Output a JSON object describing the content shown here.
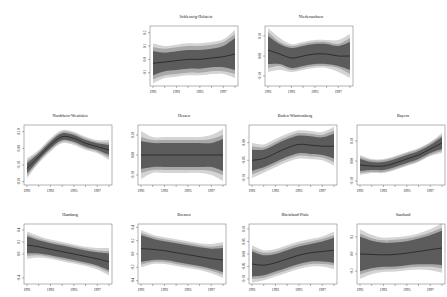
{
  "figure": {
    "background": "#ffffff",
    "band_colors": {
      "outer": "#d4d4d4",
      "middle": "#a8a8a8",
      "inner": "#5c5c5c",
      "line": "#1a1a1a"
    }
  },
  "chart_data": [
    {
      "type": "line",
      "title": "Schleswig-Holstein",
      "x": [
        1991,
        1992,
        1993,
        1994,
        1995,
        1996,
        1997,
        1998
      ],
      "xticks": [
        1991,
        1993,
        1995,
        1997
      ],
      "yticks": [
        -0.1,
        0.0,
        0.1,
        0.2
      ],
      "ytick_labels": [
        "-0.1",
        "0.0",
        "0.1",
        "0.2"
      ],
      "ylim": [
        -0.2,
        0.25
      ],
      "values": [
        -0.03,
        -0.02,
        -0.01,
        0.0,
        0.0,
        0.01,
        0.02,
        0.04
      ],
      "band_inner": [
        0.09,
        0.07,
        0.07,
        0.07,
        0.07,
        0.07,
        0.08,
        0.12
      ],
      "band_middle": [
        0.12,
        0.1,
        0.1,
        0.1,
        0.1,
        0.1,
        0.11,
        0.15
      ],
      "band_outer": [
        0.15,
        0.12,
        0.12,
        0.12,
        0.12,
        0.12,
        0.13,
        0.18
      ],
      "position": {
        "left": 130,
        "top": 14
      }
    },
    {
      "type": "line",
      "title": "Niedersachsen",
      "x": [
        1991,
        1992,
        1993,
        1994,
        1995,
        1996,
        1997,
        1998
      ],
      "xticks": [
        1991,
        1993,
        1995,
        1997
      ],
      "yticks": [
        -0.1,
        0.0,
        0.1
      ],
      "ytick_labels": [
        "-0.10",
        "0.00",
        "0.10"
      ],
      "ylim": [
        -0.15,
        0.15
      ],
      "values": [
        0.03,
        0.01,
        -0.01,
        0.0,
        0.01,
        0.01,
        0.0,
        0.0
      ],
      "band_inner": [
        0.07,
        0.05,
        0.05,
        0.05,
        0.05,
        0.05,
        0.05,
        0.07
      ],
      "band_middle": [
        0.09,
        0.06,
        0.06,
        0.06,
        0.06,
        0.06,
        0.06,
        0.09
      ],
      "band_outer": [
        0.11,
        0.08,
        0.07,
        0.07,
        0.07,
        0.07,
        0.08,
        0.11
      ],
      "position": {
        "left": 245,
        "top": 14
      }
    },
    {
      "type": "line",
      "title": "Nordrhein-Westfalen",
      "x": [
        1991,
        1992,
        1993,
        1994,
        1995,
        1996,
        1997,
        1998
      ],
      "xticks": [
        1991,
        1993,
        1995,
        1997
      ],
      "yticks": [
        -0.2,
        -0.1,
        0.0,
        0.1
      ],
      "ytick_labels": [
        "-0.20",
        "-0.10",
        "0.00",
        "0.10"
      ],
      "ylim": [
        -0.22,
        0.14
      ],
      "values": [
        -0.12,
        -0.05,
        0.02,
        0.07,
        0.06,
        0.03,
        0.01,
        -0.01
      ],
      "band_inner": [
        0.03,
        0.02,
        0.02,
        0.02,
        0.02,
        0.02,
        0.02,
        0.03
      ],
      "band_middle": [
        0.045,
        0.03,
        0.03,
        0.03,
        0.03,
        0.03,
        0.03,
        0.045
      ],
      "band_outer": [
        0.06,
        0.04,
        0.04,
        0.04,
        0.04,
        0.04,
        0.04,
        0.06
      ],
      "position": {
        "left": 4,
        "top": 113
      }
    },
    {
      "type": "line",
      "title": "Hessen",
      "x": [
        1991,
        1992,
        1993,
        1994,
        1995,
        1996,
        1997,
        1998
      ],
      "xticks": [
        1991,
        1993,
        1995,
        1997
      ],
      "yticks": [
        -0.1,
        0.0,
        0.1
      ],
      "ytick_labels": [
        "-0.10",
        "0.00",
        "0.10"
      ],
      "ylim": [
        -0.15,
        0.15
      ],
      "values": [
        0.0,
        0.0,
        0.0,
        0.0,
        0.0,
        0.0,
        0.0,
        0.0
      ],
      "band_inner": [
        0.07,
        0.06,
        0.06,
        0.06,
        0.06,
        0.06,
        0.06,
        0.08
      ],
      "band_middle": [
        0.09,
        0.075,
        0.075,
        0.075,
        0.075,
        0.075,
        0.08,
        0.1
      ],
      "band_outer": [
        0.12,
        0.09,
        0.09,
        0.09,
        0.09,
        0.09,
        0.1,
        0.13
      ],
      "position": {
        "left": 118,
        "top": 113
      }
    },
    {
      "type": "line",
      "title": "Baden-Württemberg",
      "x": [
        1991,
        1992,
        1993,
        1994,
        1995,
        1996,
        1997,
        1998
      ],
      "xticks": [
        1991,
        1993,
        1995,
        1997
      ],
      "yticks": [
        -0.1,
        -0.05,
        0.0
      ],
      "ytick_labels": [
        "-0.10",
        "-0.05",
        "0.00"
      ],
      "ylim": [
        -0.12,
        0.05
      ],
      "values": [
        -0.05,
        -0.045,
        -0.03,
        -0.015,
        -0.005,
        -0.007,
        -0.01,
        -0.01
      ],
      "band_inner": [
        0.03,
        0.025,
        0.025,
        0.025,
        0.025,
        0.025,
        0.025,
        0.035
      ],
      "band_middle": [
        0.04,
        0.032,
        0.032,
        0.032,
        0.032,
        0.032,
        0.032,
        0.045
      ],
      "band_outer": [
        0.05,
        0.04,
        0.04,
        0.04,
        0.04,
        0.04,
        0.04,
        0.055
      ],
      "position": {
        "left": 229,
        "top": 113
      }
    },
    {
      "type": "line",
      "title": "Bayern",
      "x": [
        1991,
        1992,
        1993,
        1994,
        1995,
        1996,
        1997,
        1998
      ],
      "xticks": [
        1991,
        1993,
        1995,
        1997
      ],
      "yticks": [
        -0.1,
        0.0,
        0.1
      ],
      "ytick_labels": [
        "-0.10",
        "0.00",
        "0.10"
      ],
      "ylim": [
        -0.12,
        0.18
      ],
      "values": [
        -0.02,
        -0.025,
        -0.025,
        -0.01,
        0.01,
        0.03,
        0.06,
        0.09
      ],
      "band_inner": [
        0.03,
        0.02,
        0.02,
        0.02,
        0.02,
        0.02,
        0.02,
        0.03
      ],
      "band_middle": [
        0.04,
        0.03,
        0.03,
        0.03,
        0.03,
        0.03,
        0.03,
        0.04
      ],
      "band_outer": [
        0.05,
        0.035,
        0.035,
        0.035,
        0.035,
        0.035,
        0.035,
        0.05
      ],
      "position": {
        "left": 337,
        "top": 113
      }
    },
    {
      "type": "line",
      "title": "Hamburg",
      "x": [
        1991,
        1992,
        1993,
        1994,
        1995,
        1996,
        1997,
        1998
      ],
      "xticks": [
        1991,
        1993,
        1995,
        1997
      ],
      "yticks": [
        -0.4,
        0.0,
        0.2,
        0.4
      ],
      "ytick_labels": [
        "-0.4",
        "0.0",
        "0.2",
        "0.4"
      ],
      "ylim": [
        -0.5,
        0.5
      ],
      "values": [
        0.15,
        0.12,
        0.08,
        0.04,
        0.0,
        -0.04,
        -0.08,
        -0.13
      ],
      "band_inner": [
        0.14,
        0.11,
        0.1,
        0.1,
        0.1,
        0.1,
        0.11,
        0.14
      ],
      "band_middle": [
        0.18,
        0.14,
        0.13,
        0.13,
        0.13,
        0.13,
        0.14,
        0.18
      ],
      "band_outer": [
        0.23,
        0.18,
        0.16,
        0.16,
        0.16,
        0.16,
        0.18,
        0.23
      ],
      "position": {
        "left": 4,
        "top": 212
      }
    },
    {
      "type": "line",
      "title": "Bremen",
      "x": [
        1991,
        1992,
        1993,
        1994,
        1995,
        1996,
        1997,
        1998
      ],
      "xticks": [
        1991,
        1993,
        1995,
        1997
      ],
      "yticks": [
        -0.4,
        -0.2,
        0.0,
        0.2,
        0.4
      ],
      "ytick_labels": [
        "-0.4",
        "-0.2",
        "0.0",
        "0.2",
        "0.4"
      ],
      "ylim": [
        -0.45,
        0.45
      ],
      "values": [
        0.08,
        0.07,
        0.05,
        0.02,
        -0.01,
        -0.04,
        -0.07,
        -0.09
      ],
      "band_inner": [
        0.2,
        0.16,
        0.14,
        0.14,
        0.14,
        0.14,
        0.15,
        0.18
      ],
      "band_middle": [
        0.24,
        0.19,
        0.17,
        0.17,
        0.17,
        0.17,
        0.18,
        0.22
      ],
      "band_outer": [
        0.28,
        0.22,
        0.2,
        0.2,
        0.2,
        0.2,
        0.22,
        0.27
      ],
      "position": {
        "left": 118,
        "top": 212
      }
    },
    {
      "type": "line",
      "title": "Rheinland-Pfalz",
      "x": [
        1991,
        1992,
        1993,
        1994,
        1995,
        1996,
        1997,
        1998
      ],
      "xticks": [
        1991,
        1993,
        1995,
        1997
      ],
      "yticks": [
        -0.1,
        -0.05,
        0.0,
        0.05,
        0.1
      ],
      "ytick_labels": [
        "-0.10",
        "-0.05",
        "0.00",
        "0.05",
        "0.10"
      ],
      "ylim": [
        -0.12,
        0.12
      ],
      "values": [
        -0.04,
        -0.045,
        -0.035,
        -0.02,
        -0.005,
        0.005,
        0.01,
        0.015
      ],
      "band_inner": [
        0.05,
        0.04,
        0.035,
        0.035,
        0.035,
        0.035,
        0.04,
        0.05
      ],
      "band_middle": [
        0.06,
        0.05,
        0.045,
        0.045,
        0.045,
        0.045,
        0.05,
        0.06
      ],
      "band_outer": [
        0.075,
        0.06,
        0.055,
        0.055,
        0.055,
        0.055,
        0.06,
        0.075
      ],
      "position": {
        "left": 229,
        "top": 212
      }
    },
    {
      "type": "line",
      "title": "Saarland",
      "x": [
        1991,
        1992,
        1993,
        1994,
        1995,
        1996,
        1997,
        1998
      ],
      "xticks": [
        1991,
        1993,
        1995,
        1997
      ],
      "yticks": [
        -0.2,
        0.0,
        0.2
      ],
      "ytick_labels": [
        "-0.2",
        "0.0",
        "0.2"
      ],
      "ylim": [
        -0.35,
        0.35
      ],
      "values": [
        0.0,
        -0.005,
        -0.01,
        -0.005,
        0.01,
        0.03,
        0.05,
        0.07
      ],
      "band_inner": [
        0.2,
        0.16,
        0.14,
        0.14,
        0.14,
        0.15,
        0.17,
        0.2
      ],
      "band_middle": [
        0.24,
        0.19,
        0.17,
        0.17,
        0.17,
        0.18,
        0.2,
        0.24
      ],
      "band_outer": [
        0.29,
        0.23,
        0.2,
        0.2,
        0.2,
        0.21,
        0.24,
        0.29
      ],
      "position": {
        "left": 337,
        "top": 212
      }
    }
  ]
}
